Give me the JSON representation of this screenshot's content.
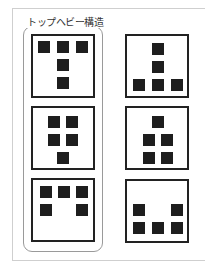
{
  "title": "トップヘビー構造",
  "colors": {
    "square": "#1e1e1e",
    "box_border": "#222222",
    "group_border": "#9a9a9a",
    "frame_border": "#cfcfcf"
  },
  "diagram": {
    "groups": [
      {
        "label": "トップヘビー構造",
        "column": "left",
        "highlighted": true
      }
    ],
    "boxes": [
      {
        "id": "left-1",
        "column": "left",
        "row": 1,
        "pattern": "top-heavy T: 3 squares on top, 1 below center, 1 below that",
        "squares": [
          [
            0,
            0
          ],
          [
            1,
            0
          ],
          [
            2,
            0
          ],
          [
            1,
            1
          ],
          [
            1,
            2
          ]
        ]
      },
      {
        "id": "right-1",
        "column": "right",
        "row": 1,
        "pattern": "bottom-heavy inverted T: 1 top center, 1 middle center, 3 on bottom",
        "squares": [
          [
            1,
            0
          ],
          [
            1,
            1
          ],
          [
            0,
            2
          ],
          [
            1,
            2
          ],
          [
            2,
            2
          ]
        ]
      },
      {
        "id": "left-2",
        "column": "left",
        "row": 2,
        "pattern": "2x2 block on top, 1 below center",
        "squares": [
          [
            0,
            0
          ],
          [
            1,
            0
          ],
          [
            0,
            1
          ],
          [
            1,
            1
          ],
          [
            0.5,
            2
          ]
        ]
      },
      {
        "id": "right-2",
        "column": "right",
        "row": 2,
        "pattern": "1 top center, 2x2 block below",
        "squares": [
          [
            0.5,
            0
          ],
          [
            0,
            1
          ],
          [
            1,
            1
          ],
          [
            0,
            2
          ],
          [
            1,
            2
          ]
        ]
      },
      {
        "id": "left-3",
        "column": "left",
        "row": 3,
        "pattern": "3 on top row, 2 corners below (top-heavy)",
        "squares": [
          [
            0,
            0
          ],
          [
            1,
            0
          ],
          [
            2,
            0
          ],
          [
            0,
            1
          ],
          [
            2,
            1
          ]
        ]
      },
      {
        "id": "right-3",
        "column": "right",
        "row": 3,
        "pattern": "2 corners above, 3 on bottom row (bottom-heavy)",
        "squares": [
          [
            0,
            1
          ],
          [
            2,
            1
          ],
          [
            0,
            2
          ],
          [
            1,
            2
          ],
          [
            2,
            2
          ]
        ]
      }
    ]
  }
}
